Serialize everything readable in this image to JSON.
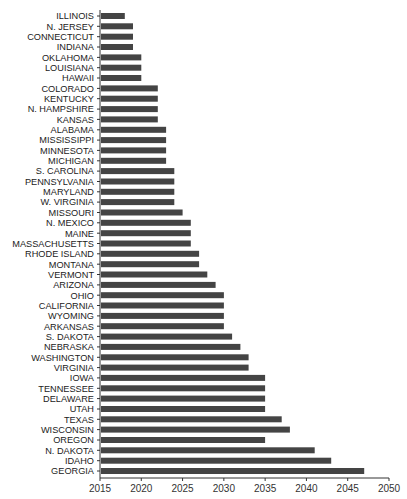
{
  "chart_data": {
    "type": "bar",
    "orientation": "horizontal",
    "title": "",
    "xlabel": "",
    "ylabel": "",
    "xlim": [
      2015,
      2050
    ],
    "xticks": [
      2015,
      2020,
      2025,
      2030,
      2035,
      2040,
      2045,
      2050
    ],
    "grid": false,
    "legend": null,
    "bar_color": "#444444",
    "categories": [
      "ILLINOIS",
      "N. JERSEY",
      "CONNECTICUT",
      "INDIANA",
      "OKLAHOMA",
      "LOUISIANA",
      "HAWAII",
      "COLORADO",
      "KENTUCKY",
      "N. HAMPSHIRE",
      "KANSAS",
      "ALABAMA",
      "MISSISSIPPI",
      "MINNESOTA",
      "MICHIGAN",
      "S. CAROLINA",
      "PENNSYLVANIA",
      "MARYLAND",
      "W. VIRGINIA",
      "MISSOURI",
      "N. MEXICO",
      "MAINE",
      "MASSACHUSETTS",
      "RHODE ISLAND",
      "MONTANA",
      "VERMONT",
      "ARIZONA",
      "OHIO",
      "CALIFORNIA",
      "WYOMING",
      "ARKANSAS",
      "S. DAKOTA",
      "NEBRASKA",
      "WASHINGTON",
      "VIRGINIA",
      "IOWA",
      "TENNESSEE",
      "DELAWARE",
      "UTAH",
      "TEXAS",
      "WISCONSIN",
      "OREGON",
      "N. DAKOTA",
      "IDAHO",
      "GEORGIA"
    ],
    "values": [
      2018,
      2019,
      2019,
      2019,
      2020,
      2020,
      2020,
      2022,
      2022,
      2022,
      2022,
      2023,
      2023,
      2023,
      2023,
      2024,
      2024,
      2024,
      2024,
      2025,
      2026,
      2026,
      2026,
      2027,
      2027,
      2028,
      2029,
      2030,
      2030,
      2030,
      2030,
      2031,
      2032,
      2033,
      2033,
      2035,
      2035,
      2035,
      2035,
      2037,
      2038,
      2035,
      2041,
      2043,
      2047
    ]
  }
}
